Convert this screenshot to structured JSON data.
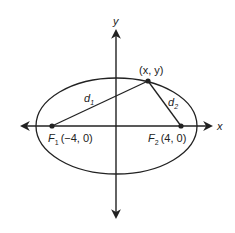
{
  "diagram": {
    "type": "ellipse-foci",
    "axes": {
      "x_label": "x",
      "y_label": "y"
    },
    "foci": [
      {
        "name": "F",
        "sub": "1",
        "coords": "(−4, 0)",
        "x": -4,
        "y": 0
      },
      {
        "name": "F",
        "sub": "2",
        "coords": "(4, 0)",
        "x": 4,
        "y": 0
      }
    ],
    "point": {
      "label": "(x, y)"
    },
    "distances": [
      {
        "name": "d",
        "sub": "1"
      },
      {
        "name": "d",
        "sub": "2"
      }
    ],
    "colors": {
      "stroke": "#222222",
      "background": "#ffffff"
    }
  }
}
